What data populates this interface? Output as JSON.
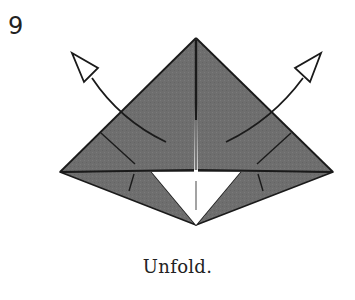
{
  "step": {
    "number": "9",
    "caption": "Unfold."
  },
  "diagram": {
    "colors": {
      "paper_colored": "#6e6e6e",
      "paper_white": "#ffffff",
      "line": "#1a1a1a",
      "crease": "#555555"
    },
    "arrows": [
      {
        "name": "unfold-arrow-left",
        "direction": "up-left",
        "head": "hollow"
      },
      {
        "name": "unfold-arrow-right",
        "direction": "up-right",
        "head": "hollow"
      }
    ]
  }
}
